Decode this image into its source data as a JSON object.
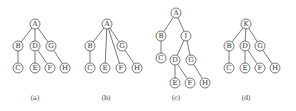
{
  "figure": {
    "node_radius": 5,
    "colors": {
      "stroke": "#555555",
      "text": "#333333",
      "background": "#ffffff"
    },
    "trees": [
      {
        "caption": "(a)",
        "caption_pos": [
          35,
          100
        ],
        "nodes": [
          {
            "id": "A",
            "x": 35,
            "y": 24
          },
          {
            "id": "B",
            "x": 18,
            "y": 46
          },
          {
            "id": "D",
            "x": 35,
            "y": 46
          },
          {
            "id": "G",
            "x": 51,
            "y": 46
          },
          {
            "id": "C",
            "x": 18,
            "y": 68
          },
          {
            "id": "E",
            "x": 35,
            "y": 68
          },
          {
            "id": "F",
            "x": 50,
            "y": 68
          },
          {
            "id": "H",
            "x": 65,
            "y": 68
          }
        ],
        "edges": [
          [
            "A",
            "B"
          ],
          [
            "A",
            "D"
          ],
          [
            "A",
            "G"
          ],
          [
            "B",
            "C"
          ],
          [
            "D",
            "E"
          ],
          [
            "D",
            "F"
          ],
          [
            "G",
            "H"
          ]
        ]
      },
      {
        "caption": "(b)",
        "caption_pos": [
          106,
          100
        ],
        "nodes": [
          {
            "id": "A",
            "x": 107,
            "y": 24
          },
          {
            "id": "B",
            "x": 90,
            "y": 46
          },
          {
            "id": "G",
            "x": 122,
            "y": 46
          },
          {
            "id": "C",
            "x": 90,
            "y": 68
          },
          {
            "id": "E",
            "x": 105,
            "y": 68
          },
          {
            "id": "F",
            "x": 121,
            "y": 68
          },
          {
            "id": "H",
            "x": 137,
            "y": 68
          }
        ],
        "edges": [
          [
            "A",
            "B"
          ],
          [
            "A",
            "E"
          ],
          [
            "A",
            "F"
          ],
          [
            "A",
            "G"
          ],
          [
            "B",
            "C"
          ],
          [
            "G",
            "H"
          ]
        ]
      },
      {
        "caption": "(c)",
        "caption_pos": [
          176,
          100
        ],
        "nodes": [
          {
            "id": "A",
            "x": 176,
            "y": 13
          },
          {
            "id": "B",
            "x": 161,
            "y": 36
          },
          {
            "id": "I",
            "x": 186,
            "y": 36
          },
          {
            "id": "C",
            "x": 161,
            "y": 58
          },
          {
            "id": "D",
            "x": 175,
            "y": 60
          },
          {
            "id": "G",
            "x": 191,
            "y": 60
          },
          {
            "id": "E",
            "x": 175,
            "y": 83
          },
          {
            "id": "F",
            "x": 190,
            "y": 83
          },
          {
            "id": "H",
            "x": 205,
            "y": 83
          }
        ],
        "edges": [
          [
            "A",
            "B"
          ],
          [
            "A",
            "I"
          ],
          [
            "B",
            "C"
          ],
          [
            "I",
            "D"
          ],
          [
            "I",
            "G"
          ],
          [
            "D",
            "E"
          ],
          [
            "D",
            "F"
          ],
          [
            "G",
            "H"
          ]
        ]
      },
      {
        "caption": "(d)",
        "caption_pos": [
          246,
          100
        ],
        "nodes": [
          {
            "id": "K",
            "x": 246,
            "y": 24
          },
          {
            "id": "B",
            "x": 229,
            "y": 46
          },
          {
            "id": "D",
            "x": 245,
            "y": 46
          },
          {
            "id": "G",
            "x": 260,
            "y": 46
          },
          {
            "id": "C",
            "x": 229,
            "y": 68
          },
          {
            "id": "E",
            "x": 245,
            "y": 68
          },
          {
            "id": "F",
            "x": 260,
            "y": 68
          },
          {
            "id": "H",
            "x": 275,
            "y": 68
          }
        ],
        "edges": [
          [
            "K",
            "B"
          ],
          [
            "K",
            "D"
          ],
          [
            "K",
            "G"
          ],
          [
            "B",
            "C"
          ],
          [
            "D",
            "E"
          ],
          [
            "D",
            "F"
          ],
          [
            "G",
            "H"
          ]
        ]
      }
    ]
  }
}
